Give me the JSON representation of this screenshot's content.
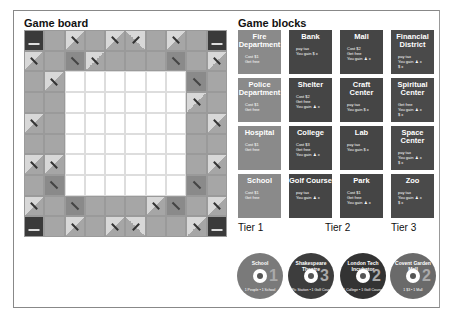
{
  "headings": {
    "board": "Game board",
    "blocks": "Game blocks"
  },
  "board": {
    "rows": [
      [
        "c",
        "g",
        "l",
        "g",
        "l",
        "lr",
        "g",
        "l",
        "g",
        "c"
      ],
      [
        "l",
        "g",
        "d",
        "l",
        "g",
        "g",
        "g",
        "d",
        "g",
        "l"
      ],
      [
        "g",
        "l",
        "w",
        "w",
        "w",
        "w",
        "w",
        "w",
        "d",
        "g"
      ],
      [
        "g",
        "g",
        "w",
        "w",
        "w",
        "w",
        "w",
        "w",
        "l",
        "g"
      ],
      [
        "l",
        "g",
        "w",
        "w",
        "w",
        "w",
        "w",
        "w",
        "g",
        "l"
      ],
      [
        "g",
        "g",
        "w",
        "w",
        "w",
        "w",
        "w",
        "w",
        "g",
        "g"
      ],
      [
        "l",
        "l",
        "w",
        "w",
        "w",
        "w",
        "w",
        "w",
        "g",
        "l"
      ],
      [
        "g",
        "d",
        "w",
        "w",
        "w",
        "w",
        "w",
        "w",
        "d",
        "g"
      ],
      [
        "l",
        "g",
        "d",
        "g",
        "g",
        "g",
        "l",
        "d",
        "g",
        "l"
      ],
      [
        "c",
        "g",
        "l",
        "g",
        "l",
        "lr",
        "g",
        "g",
        "l",
        "c"
      ]
    ]
  },
  "blocks": {
    "columns": [
      {
        "tier": "Tier 1",
        "cards": [
          {
            "name": "Fire Department",
            "lines": [
              "Cost $1",
              "Get free"
            ]
          },
          {
            "name": "Police Department",
            "lines": [
              "Cost $1",
              "Get free"
            ]
          },
          {
            "name": "Hospital",
            "lines": [
              "Cost $1",
              "Get free"
            ]
          },
          {
            "name": "School",
            "lines": [
              "Cost $1",
              "Get free"
            ]
          }
        ]
      },
      {
        "tier": "Tier 2",
        "cards": [
          {
            "name": "Bank",
            "lines": [
              "pay tax",
              "You gain $ x"
            ]
          },
          {
            "name": "Shelter",
            "lines": [
              "Cost $2",
              "Get free",
              "You gain ♟ x"
            ]
          },
          {
            "name": "College",
            "lines": [
              "Cost $3",
              "Get free",
              "You gain ♟ x"
            ]
          },
          {
            "name": "Golf Course",
            "lines": [
              "pay tax",
              "You gain ♟ x"
            ]
          }
        ]
      },
      {
        "tier": "",
        "cards": [
          {
            "name": "Mall",
            "lines": [
              "Cost $2",
              "Get free",
              "You gain ♟ x"
            ]
          },
          {
            "name": "Craft Center",
            "lines": [
              "pay tax",
              "You gain $ x"
            ]
          },
          {
            "name": "Lab",
            "lines": [
              "pay tax",
              "You gain $ x"
            ]
          },
          {
            "name": "Park",
            "lines": [
              "Cost $1",
              "Get free",
              "You gain ♟ x"
            ]
          }
        ]
      },
      {
        "tier": "Tier 3",
        "cards": [
          {
            "name": "Financial District",
            "lines": [
              "pay tax",
              "You gain ♟ x",
              "$ x"
            ]
          },
          {
            "name": "Spiritual Center",
            "lines": [
              "Get free",
              "You gain ♟ x",
              "$ x"
            ]
          },
          {
            "name": "Space Center",
            "lines": [
              "pay tax",
              "You gain ♟ x",
              "$ x"
            ]
          },
          {
            "name": "Zoo",
            "lines": [
              "pay tax",
              "You gain ♟ x",
              "$ x"
            ]
          }
        ]
      }
    ]
  },
  "discs": [
    {
      "title": "School",
      "number": "1",
      "bottom": "1 People • 1 School",
      "color": "#7a7a7a"
    },
    {
      "title": "Shakespeare Theatre",
      "number": "3",
      "bottom": "1 Pic Station • 1 Golf Course",
      "color": "#3d3d3d"
    },
    {
      "title": "London Tech Incubator",
      "number": "2",
      "bottom": "1 College • 1 Golf Course",
      "color": "#333333"
    },
    {
      "title": "Covent Garden Mall",
      "number": "2",
      "bottom": "1 $3 • 1 Mall",
      "color": "#6a6a6a"
    }
  ]
}
